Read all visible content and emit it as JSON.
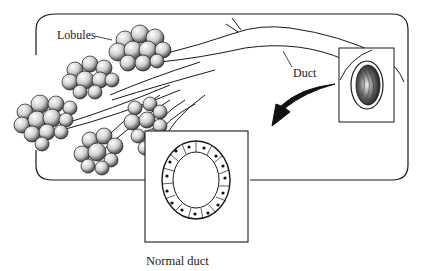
{
  "diagram": {
    "type": "anatomical illustration",
    "labels": {
      "lobules": "Lobules",
      "duct": "Duct",
      "normal_duct": "Normal duct"
    },
    "colors": {
      "stroke": "#1a1a1a",
      "background": "#ffffff",
      "lobule_fill": "#d9d9d9",
      "shading": "#555555"
    },
    "elements": [
      {
        "id": "frame",
        "kind": "rounded-rectangle",
        "desc": "outer rounded frame containing the duct system"
      },
      {
        "id": "lobule-clusters",
        "kind": "grape-like clusters",
        "count": 5
      },
      {
        "id": "duct-branches",
        "kind": "branching tubes",
        "desc": "ducts converge into one main duct to the right"
      },
      {
        "id": "duct-end-inset",
        "kind": "square inset",
        "desc": "cut-end of the duct showing lumen"
      },
      {
        "id": "arrow",
        "kind": "curved black arrow",
        "desc": "points down-left toward cross-section"
      },
      {
        "id": "cross-section-inset",
        "kind": "square inset",
        "desc": "ring of epithelial cells with nuclei",
        "cell_count": 18
      }
    ]
  }
}
